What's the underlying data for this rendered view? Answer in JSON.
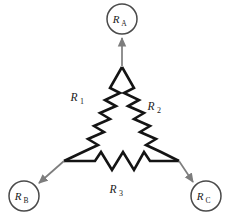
{
  "figure": {
    "type": "delta-resistor-network-diagram",
    "background_color": "#ffffff",
    "wire_color": "#141414",
    "arrow_color": "#7d7d7d",
    "terminal_circle_color": "#4a4a4a",
    "label_color": "#1a1a1a"
  },
  "terminals": [
    {
      "id": "A",
      "name": "terminal-a",
      "base": "R",
      "subscript": "A",
      "circle": {
        "cx": 122,
        "cy": 19,
        "r": 15
      },
      "label_x": 116,
      "label_y": 23,
      "sub_x": 124,
      "sub_y": 26,
      "arrow": {
        "x1": 122,
        "y1": 66,
        "x2": 122,
        "y2": 37
      }
    },
    {
      "id": "B",
      "name": "terminal-b",
      "base": "R",
      "subscript": "B",
      "circle": {
        "cx": 24,
        "cy": 196,
        "r": 15
      },
      "label_x": 18,
      "label_y": 200,
      "sub_x": 26,
      "sub_y": 203,
      "arrow": {
        "x1": 64,
        "y1": 161,
        "x2": 38,
        "y2": 184
      }
    },
    {
      "id": "C",
      "name": "terminal-c",
      "base": "R",
      "subscript": "C",
      "circle": {
        "cx": 206,
        "cy": 196,
        "r": 15
      },
      "label_x": 200,
      "label_y": 200,
      "sub_x": 208,
      "sub_y": 203,
      "arrow": {
        "x1": 179,
        "y1": 161,
        "x2": 194,
        "y2": 183
      }
    }
  ],
  "resistors": [
    {
      "id": "R1",
      "name": "resistor-r1",
      "base": "R",
      "subscript": "1",
      "label_x": 74,
      "label_y": 101,
      "sub_x": 82,
      "sub_y": 104,
      "path": "M 122 67 L 110 88 L 120 93 L 105 100 L 116 106 L 100 113 L 110 119 L 94 126 L 104 132 L 88 139 L 98 145 L 83 152 L 64 161"
    },
    {
      "id": "R2",
      "name": "resistor-r2",
      "base": "R",
      "subscript": "2",
      "label_x": 151,
      "label_y": 110,
      "sub_x": 159,
      "sub_y": 113,
      "path": "M 122 67 L 134 88 L 124 93 L 139 100 L 128 106 L 144 113 L 134 119 L 150 126 L 140 132 L 156 139 L 146 145 L 161 152 L 179 161"
    },
    {
      "id": "R3",
      "name": "resistor-r3",
      "base": "R",
      "subscript": "3",
      "label_x": 113,
      "label_y": 193,
      "sub_x": 121,
      "sub_y": 196,
      "path": "M 64 161 L 95 161 L 101 152 L 112 170 L 123 152 L 134 170 L 144 152 L 150 161 L 179 161"
    }
  ]
}
